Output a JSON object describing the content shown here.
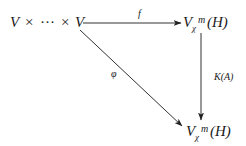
{
  "diagram": {
    "type": "commutative-diagram",
    "nodes": {
      "source": {
        "base": "V",
        "times": "×",
        "dots": "···",
        "end": "V"
      },
      "top_right": {
        "base": "V",
        "subscript": "χ",
        "superscript": "m",
        "arg": "(H)"
      },
      "bottom_right": {
        "base": "V",
        "subscript": "χ",
        "superscript": "m",
        "arg": "(H)"
      }
    },
    "arrows": [
      {
        "id": "f",
        "from": "source",
        "to": "top_right",
        "label": "f"
      },
      {
        "id": "phi",
        "from": "source",
        "to": "bottom_right",
        "label": "φ"
      },
      {
        "id": "KA",
        "from": "top_right",
        "to": "bottom_right",
        "label": "K(A)"
      }
    ]
  }
}
